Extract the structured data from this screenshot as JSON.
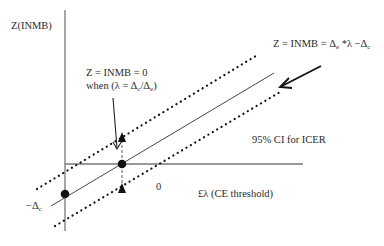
{
  "diagram": {
    "y_axis_label": "Z(INMB)",
    "x_axis_label": "£λ (CE threshold)",
    "origin_label": "0",
    "intercept_label": "−Δ",
    "intercept_label_sub": "c",
    "zero_annotation": {
      "line1": "Z = INMB = 0",
      "line2_prefix": "when (λ = Δ",
      "line2_sub1": "c",
      "line2_mid": "/Δ",
      "line2_sub2": "e",
      "line2_suffix": ")"
    },
    "equation_annotation": {
      "prefix": "Z = INMB = Δ",
      "sub1": "e",
      "mid": " *λ −Δ",
      "sub2": "c"
    },
    "ci_label": "95% CI for ICER",
    "colors": {
      "axis": "#777777",
      "line": "#333333",
      "marker": "#111111"
    }
  }
}
